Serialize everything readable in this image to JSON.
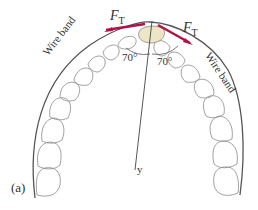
{
  "figure": {
    "panel_label": "(a)",
    "axis_label": "y",
    "forces": [
      {
        "symbol": "F",
        "subscript": "T",
        "side": "left"
      },
      {
        "symbol": "F",
        "subscript": "T",
        "side": "right"
      }
    ],
    "angles": [
      {
        "label": "70°",
        "side": "left"
      },
      {
        "label": "70°",
        "side": "right"
      }
    ],
    "wire_labels": [
      {
        "text": "Wire band",
        "side": "left"
      },
      {
        "text": "Wire band",
        "side": "right"
      }
    ],
    "colors": {
      "wire": "#555555",
      "tooth_outline": "#8a8a8a",
      "force_vector": "#b0124a",
      "target_tooth_fill": "#ece6c4"
    }
  }
}
